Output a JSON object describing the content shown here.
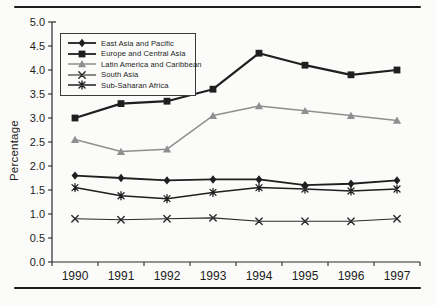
{
  "figure": {
    "background_color": "#fbfbf9",
    "rule_color": "#1c1c1c",
    "axis_color": "#2a2a2a"
  },
  "chart_data": {
    "type": "line",
    "title": "",
    "xlabel": "",
    "ylabel": "Percentage",
    "x": [
      "1990",
      "1991",
      "1992",
      "1993",
      "1994",
      "1995",
      "1996",
      "1997"
    ],
    "ylim": [
      0.0,
      5.0
    ],
    "ytick_step": 0.5,
    "yticks": [
      "0.0",
      "0.5",
      "1.0",
      "1.5",
      "2.0",
      "2.5",
      "3.0",
      "3.5",
      "4.0",
      "4.5",
      "5.0"
    ],
    "grid": false,
    "legend_position": "top-left-inside",
    "series": [
      {
        "name": "East Asia and Pacific",
        "marker": "diamond",
        "color": "#1f1f1f",
        "line_width": 1.8,
        "values": [
          1.8,
          1.75,
          1.7,
          1.72,
          1.72,
          1.6,
          1.63,
          1.7
        ]
      },
      {
        "name": "Europe and Central Asia",
        "marker": "square",
        "color": "#1f1f1f",
        "line_width": 2.2,
        "values": [
          3.0,
          3.3,
          3.35,
          3.6,
          4.35,
          4.1,
          3.9,
          4.0
        ]
      },
      {
        "name": "Latin America and Caribbean",
        "marker": "triangle",
        "color": "#8f8f8f",
        "line_width": 1.5,
        "values": [
          2.55,
          2.3,
          2.35,
          3.05,
          3.25,
          3.15,
          3.05,
          2.95
        ]
      },
      {
        "name": "South Asia",
        "marker": "x",
        "color": "#2a2a2a",
        "line_width": 1.1,
        "values": [
          0.9,
          0.88,
          0.9,
          0.92,
          0.85,
          0.85,
          0.85,
          0.9
        ]
      },
      {
        "name": "Sub-Saharan Africa",
        "marker": "asterisk",
        "color": "#1f1f1f",
        "line_width": 1.5,
        "values": [
          1.55,
          1.38,
          1.32,
          1.45,
          1.55,
          1.52,
          1.48,
          1.52
        ]
      }
    ]
  }
}
